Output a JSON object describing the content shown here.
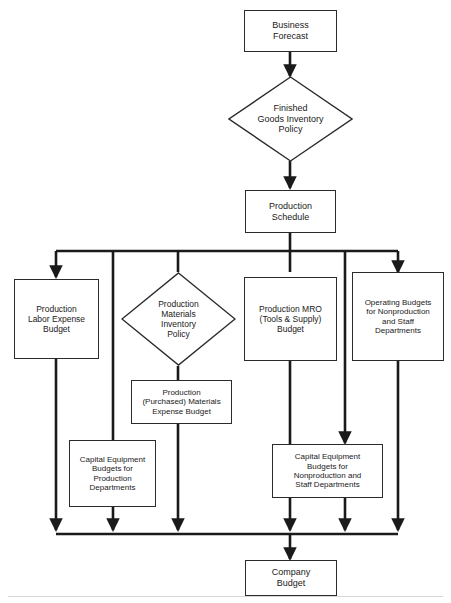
{
  "diagram": {
    "type": "flowchart",
    "background": "#ffffff",
    "line_color": "#1a1a1a",
    "text_color": "#1a1a1a",
    "nodes": [
      {
        "id": "business-forecast",
        "shape": "rectangle",
        "label": "Business\nForecast"
      },
      {
        "id": "finished-goods-policy",
        "shape": "diamond",
        "label": "Finished\nGoods Inventory\nPolicy"
      },
      {
        "id": "production-schedule",
        "shape": "rectangle",
        "label": "Production\nSchedule"
      },
      {
        "id": "production-labor",
        "shape": "rectangle",
        "label": "Production\nLabor Expense\nBudget"
      },
      {
        "id": "materials-policy",
        "shape": "diamond",
        "label": "Production\nMaterials\nInventory\nPolicy"
      },
      {
        "id": "production-mro",
        "shape": "rectangle",
        "label": "Production MRO\n(Tools & Supply)\nBudget"
      },
      {
        "id": "operating-nonproduction",
        "shape": "rectangle",
        "label": "Operating Budgets\nfor Nonproduction\nand Staff\nDepartments"
      },
      {
        "id": "materials-expense",
        "shape": "rectangle",
        "label": "Production\n(Purchased) Materials\nExpense Budget"
      },
      {
        "id": "capital-production",
        "shape": "rectangle",
        "label": "Capital Equipment\nBudgets for\nProduction\nDepartments"
      },
      {
        "id": "capital-nonproduction",
        "shape": "rectangle",
        "label": "Capital Equipment\nBudgets for\nNonproduction and\nStaff Departments"
      },
      {
        "id": "company-budget",
        "shape": "rectangle",
        "label": "Company\nBudget"
      }
    ],
    "edges": [
      {
        "from": "business-forecast",
        "to": "finished-goods-policy"
      },
      {
        "from": "finished-goods-policy",
        "to": "production-schedule"
      },
      {
        "from": "production-schedule",
        "to": "production-labor"
      },
      {
        "from": "production-schedule",
        "to": "materials-policy"
      },
      {
        "from": "production-schedule",
        "to": "production-mro"
      },
      {
        "from": "production-schedule",
        "to": "operating-nonproduction"
      },
      {
        "from": "production-schedule",
        "to": "capital-production"
      },
      {
        "from": "production-schedule",
        "to": "capital-nonproduction"
      },
      {
        "from": "materials-policy",
        "to": "materials-expense"
      },
      {
        "from": "production-labor",
        "to": "company-budget"
      },
      {
        "from": "materials-expense",
        "to": "company-budget"
      },
      {
        "from": "capital-production",
        "to": "company-budget"
      },
      {
        "from": "production-mro",
        "to": "company-budget"
      },
      {
        "from": "capital-nonproduction",
        "to": "company-budget"
      },
      {
        "from": "operating-nonproduction",
        "to": "company-budget"
      }
    ]
  }
}
